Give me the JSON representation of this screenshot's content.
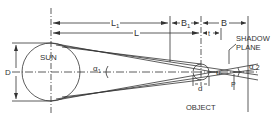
{
  "diagram": {
    "labels": {
      "L1": "L",
      "L1_sub": "1",
      "L": "L",
      "B1": "B",
      "B1_sub": "1",
      "B": "B",
      "t": "t",
      "shadow_plane_line1": "SHADOW",
      "shadow_plane_line2": "PLANE",
      "D": "D",
      "sun": "SUN",
      "alpha1": "α",
      "alpha1_sub": "1",
      "alpha2": "α",
      "alpha2_sub": "2",
      "u": "u",
      "d": "d",
      "p": "P",
      "object": "OBJECT"
    },
    "colors": {
      "line": "#333333",
      "background": "#ffffff"
    }
  }
}
